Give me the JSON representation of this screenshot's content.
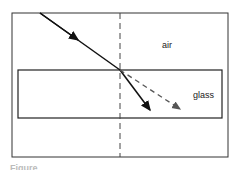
{
  "diagram": {
    "labels": {
      "air": "air",
      "glass": "glass"
    },
    "caption": "Figure",
    "elements": {
      "incident_ray": "solid arrow from air to boundary",
      "refracted_ray": "solid arrow bending toward normal in glass",
      "undeviated_path": "dashed arrow continuing original direction",
      "normal": "dashed vertical line"
    },
    "colors": {
      "line": "#222222",
      "dashed": "#555555"
    }
  }
}
